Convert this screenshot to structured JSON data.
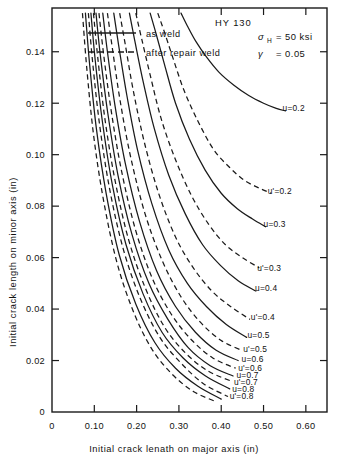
{
  "figure": {
    "material_label": "HY 130",
    "annotations": [
      {
        "symbol": "σ",
        "subscript": "H",
        "text": "= 50 ksi"
      },
      {
        "symbol": "γ",
        "subscript": "",
        "text": "= 0.05"
      }
    ],
    "legend": [
      {
        "style": "solid",
        "label": "as  weld"
      },
      {
        "style": "dashed",
        "label": "after repair weld"
      }
    ]
  },
  "chart_data": {
    "type": "line",
    "title": "HY 130",
    "xlabel": "Initial crack lenath on major axis (in)",
    "ylabel": "Initial crack length on minor axis (in)",
    "xlim": [
      0,
      0.65
    ],
    "ylim": [
      0,
      0.157
    ],
    "xticks": [
      0,
      0.1,
      0.2,
      0.3,
      0.4,
      0.5,
      0.6
    ],
    "xticklabels": [
      "0",
      "0.10",
      "0.20",
      "0.30",
      "0.40",
      "0.50",
      "0.60"
    ],
    "yticks": [
      0,
      0.02,
      0.04,
      0.06,
      0.08,
      0.1,
      0.12,
      0.14
    ],
    "yticklabels": [
      "0",
      "0.02",
      "0.04",
      "0.06",
      "0.08",
      "0.10",
      "0.12",
      "0.14"
    ],
    "grid": false,
    "legend_position": "top-left",
    "series": [
      {
        "name": "u=0.2",
        "style": "solid",
        "label": "u=0.2",
        "label_xy": [
          0.545,
          0.118
        ],
        "x": [
          0.305,
          0.32,
          0.34,
          0.365,
          0.395,
          0.43,
          0.465,
          0.5,
          0.53,
          0.552
        ],
        "y": [
          0.155,
          0.15,
          0.144,
          0.138,
          0.132,
          0.127,
          0.123,
          0.12,
          0.118,
          0.117
        ]
      },
      {
        "name": "u'=0.2",
        "style": "dashed",
        "label": "u'=0.2",
        "label_xy": [
          0.51,
          0.086
        ],
        "x": [
          0.25,
          0.265,
          0.285,
          0.312,
          0.345,
          0.382,
          0.42,
          0.455,
          0.49,
          0.518
        ],
        "y": [
          0.155,
          0.148,
          0.138,
          0.125,
          0.113,
          0.102,
          0.095,
          0.09,
          0.087,
          0.085
        ]
      },
      {
        "name": "u=0.3",
        "style": "solid",
        "label": "u=0.3",
        "label_xy": [
          0.5,
          0.073
        ],
        "x": [
          0.232,
          0.246,
          0.266,
          0.292,
          0.325,
          0.362,
          0.4,
          0.438,
          0.474,
          0.505
        ],
        "y": [
          0.155,
          0.147,
          0.135,
          0.12,
          0.106,
          0.094,
          0.085,
          0.079,
          0.075,
          0.072
        ]
      },
      {
        "name": "u'=0.3",
        "style": "dashed",
        "label": "u'=0.3",
        "label_xy": [
          0.485,
          0.056
        ],
        "x": [
          0.198,
          0.212,
          0.232,
          0.258,
          0.292,
          0.33,
          0.37,
          0.41,
          0.45,
          0.49
        ],
        "y": [
          0.155,
          0.145,
          0.131,
          0.114,
          0.098,
          0.084,
          0.073,
          0.065,
          0.06,
          0.056
        ]
      },
      {
        "name": "u=0.4",
        "style": "solid",
        "label": "u=0.4",
        "label_xy": [
          0.48,
          0.048
        ],
        "x": [
          0.183,
          0.196,
          0.216,
          0.242,
          0.276,
          0.315,
          0.356,
          0.398,
          0.44,
          0.482
        ],
        "y": [
          0.155,
          0.144,
          0.128,
          0.11,
          0.092,
          0.077,
          0.065,
          0.057,
          0.051,
          0.047
        ]
      },
      {
        "name": "u'=0.4",
        "style": "dashed",
        "label": "u'=0.4",
        "label_xy": [
          0.47,
          0.037
        ],
        "x": [
          0.16,
          0.173,
          0.192,
          0.218,
          0.252,
          0.292,
          0.334,
          0.378,
          0.422,
          0.468
        ],
        "y": [
          0.155,
          0.143,
          0.125,
          0.105,
          0.085,
          0.068,
          0.056,
          0.047,
          0.041,
          0.036
        ]
      },
      {
        "name": "u=0.5",
        "style": "solid",
        "label": "u=0.5",
        "label_xy": [
          0.462,
          0.03
        ],
        "x": [
          0.146,
          0.158,
          0.177,
          0.202,
          0.236,
          0.276,
          0.32,
          0.365,
          0.412,
          0.46
        ],
        "y": [
          0.155,
          0.142,
          0.123,
          0.102,
          0.081,
          0.063,
          0.05,
          0.041,
          0.034,
          0.029
        ]
      },
      {
        "name": "u'=0.5",
        "style": "dashed",
        "label": "u'=0.5",
        "label_xy": [
          0.452,
          0.0245
        ],
        "x": [
          0.131,
          0.143,
          0.161,
          0.186,
          0.22,
          0.26,
          0.304,
          0.35,
          0.398,
          0.448
        ],
        "y": [
          0.155,
          0.141,
          0.121,
          0.099,
          0.077,
          0.059,
          0.045,
          0.035,
          0.028,
          0.024
        ]
      },
      {
        "name": "u=0.6",
        "style": "solid",
        "label": "u=0.6",
        "label_xy": [
          0.448,
          0.0205
        ],
        "x": [
          0.12,
          0.131,
          0.149,
          0.174,
          0.207,
          0.247,
          0.292,
          0.339,
          0.388,
          0.44
        ],
        "y": [
          0.155,
          0.14,
          0.119,
          0.096,
          0.074,
          0.055,
          0.041,
          0.031,
          0.024,
          0.02
        ]
      },
      {
        "name": "u'=0.6",
        "style": "dashed",
        "label": "u'=0.6",
        "label_xy": [
          0.44,
          0.0172
        ],
        "x": [
          0.111,
          0.122,
          0.14,
          0.164,
          0.197,
          0.237,
          0.282,
          0.33,
          0.38,
          0.434
        ],
        "y": [
          0.155,
          0.139,
          0.117,
          0.094,
          0.071,
          0.052,
          0.038,
          0.028,
          0.021,
          0.017
        ]
      },
      {
        "name": "u=0.7",
        "style": "solid",
        "label": "u=0.7",
        "label_xy": [
          0.436,
          0.0143
        ],
        "x": [
          0.104,
          0.114,
          0.132,
          0.156,
          0.189,
          0.229,
          0.274,
          0.322,
          0.374,
          0.428
        ],
        "y": [
          0.155,
          0.139,
          0.116,
          0.092,
          0.069,
          0.05,
          0.036,
          0.025,
          0.018,
          0.014
        ]
      },
      {
        "name": "u'=0.7",
        "style": "dashed",
        "label": "u'=0.7",
        "label_xy": [
          0.43,
          0.0117
        ],
        "x": [
          0.098,
          0.108,
          0.125,
          0.149,
          0.181,
          0.221,
          0.266,
          0.315,
          0.368,
          0.424
        ],
        "y": [
          0.155,
          0.138,
          0.114,
          0.09,
          0.067,
          0.048,
          0.033,
          0.023,
          0.016,
          0.012
        ]
      },
      {
        "name": "u=0.8",
        "style": "solid",
        "label": "u=0.8",
        "label_xy": [
          0.426,
          0.009
        ],
        "x": [
          0.092,
          0.102,
          0.119,
          0.143,
          0.175,
          0.215,
          0.26,
          0.31,
          0.363,
          0.42
        ],
        "y": [
          0.155,
          0.137,
          0.113,
          0.088,
          0.065,
          0.046,
          0.031,
          0.021,
          0.014,
          0.009
        ]
      },
      {
        "name": "u'=0.8",
        "style": "dashed",
        "label": "u'=0.8",
        "label_xy": [
          0.42,
          0.0062
        ],
        "x": [
          0.086,
          0.096,
          0.113,
          0.137,
          0.169,
          0.209,
          0.255,
          0.305,
          0.358,
          0.416
        ],
        "y": [
          0.155,
          0.136,
          0.111,
          0.086,
          0.063,
          0.044,
          0.029,
          0.019,
          0.011,
          0.006
        ]
      },
      {
        "name": "extra-solid-a",
        "style": "solid",
        "label": "",
        "label_xy": null,
        "x": [
          0.079,
          0.089,
          0.105,
          0.128,
          0.159,
          0.198,
          0.243,
          0.292,
          0.345,
          0.4
        ],
        "y": [
          0.155,
          0.135,
          0.11,
          0.085,
          0.061,
          0.042,
          0.027,
          0.017,
          0.01,
          0.005
        ]
      },
      {
        "name": "extra-dash-a",
        "style": "dashed",
        "label": "",
        "label_xy": null,
        "x": [
          0.072,
          0.082,
          0.098,
          0.121,
          0.152,
          0.19,
          0.234,
          0.282,
          0.334,
          0.388
        ],
        "y": [
          0.155,
          0.134,
          0.108,
          0.083,
          0.059,
          0.04,
          0.025,
          0.015,
          0.008,
          0.004
        ]
      }
    ]
  }
}
